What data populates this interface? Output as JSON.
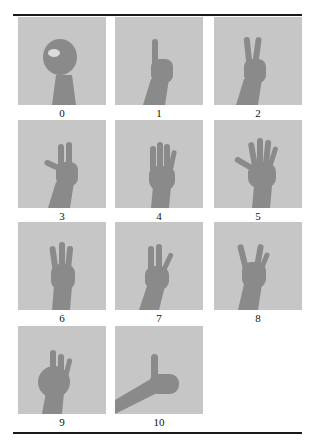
{
  "figure": {
    "panels": [
      {
        "label": "0",
        "gesture": "closed-circle"
      },
      {
        "label": "1",
        "gesture": "one-finger"
      },
      {
        "label": "2",
        "gesture": "two-fingers"
      },
      {
        "label": "3",
        "gesture": "three-fingers-with-thumb"
      },
      {
        "label": "4",
        "gesture": "four-fingers"
      },
      {
        "label": "5",
        "gesture": "open-palm"
      },
      {
        "label": "6",
        "gesture": "three-fingers"
      },
      {
        "label": "7",
        "gesture": "three-fingers-alt"
      },
      {
        "label": "8",
        "gesture": "horns-fingers"
      },
      {
        "label": "9",
        "gesture": "ok-three-fingers"
      },
      {
        "label": "10",
        "gesture": "thumbs-up"
      }
    ],
    "colors": {
      "panel_background": "#c6c6c6",
      "hand": "#8c8c8c",
      "rule": "#1a1a1a"
    }
  }
}
